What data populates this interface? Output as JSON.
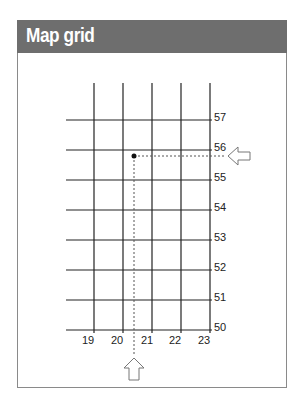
{
  "header": {
    "title": "Map grid"
  },
  "grid": {
    "x_labels": [
      "19",
      "20",
      "21",
      "22",
      "23"
    ],
    "y_labels": [
      "57",
      "56",
      "55",
      "54",
      "53",
      "52",
      "51",
      "50"
    ],
    "point": {
      "easting": "20.4",
      "northing": "55.9"
    },
    "arrows": {
      "right": "arrow-left-icon",
      "bottom": "arrow-up-icon"
    }
  },
  "colors": {
    "header_bg": "#6e6e6e",
    "line": "#222222",
    "dashed": "#555555"
  }
}
